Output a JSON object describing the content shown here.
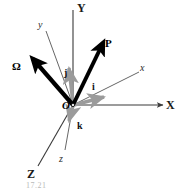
{
  "figure": {
    "origin_label": "O",
    "caption": "17.21",
    "colors": {
      "fixed_axis": "#3a3a3a",
      "body_axis": "#555555",
      "vector": "#000000",
      "unit_vector": "#9b9b9b",
      "background": "#ffffff"
    },
    "origin": {
      "x": 73,
      "y": 105
    },
    "fixed_axes": [
      {
        "name": "Y",
        "label": "Y",
        "label_x": 77,
        "label_y": 2,
        "tip_x": 73,
        "tip_y": 10
      },
      {
        "name": "X",
        "label": "X",
        "label_x": 166,
        "label_y": 99,
        "tip_x": 163,
        "tip_y": 105
      },
      {
        "name": "Z",
        "label": "Z",
        "label_x": 27,
        "label_y": 168,
        "tip_x": 38,
        "tip_y": 166
      }
    ],
    "body_axes": [
      {
        "name": "y",
        "label": "y",
        "label_x": 38,
        "label_y": 20,
        "tip_x": 46,
        "tip_y": 31
      },
      {
        "name": "x",
        "label": "x",
        "label_x": 140,
        "label_y": 63,
        "tip_x": 139,
        "tip_y": 72
      },
      {
        "name": "z",
        "label": "z",
        "label_x": 59,
        "label_y": 154,
        "tip_x": 65,
        "tip_y": 150
      }
    ],
    "vectors": [
      {
        "name": "omega",
        "label": "Ω",
        "label_x": 12,
        "label_y": 61,
        "tip_x": 33,
        "tip_y": 59
      },
      {
        "name": "p",
        "label": "P",
        "label_x": 105,
        "label_y": 38,
        "tip_x": 103,
        "tip_y": 43
      }
    ],
    "unit_vectors": [
      {
        "name": "i",
        "label": "i",
        "label_x": 92,
        "label_y": 82,
        "tip_x": 104,
        "tip_y": 97
      },
      {
        "name": "j",
        "label": "j",
        "label_x": 64,
        "label_y": 68,
        "tip_x": 69,
        "tip_y": 68
      },
      {
        "name": "k",
        "label": "k",
        "label_x": 77,
        "label_y": 121,
        "tip_x": 69,
        "tip_y": 121
      }
    ]
  }
}
